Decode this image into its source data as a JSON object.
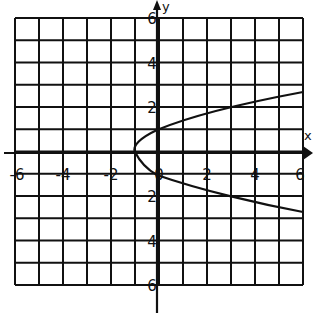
{
  "chart_data": {
    "type": "line",
    "title": "",
    "xlabel": "x",
    "ylabel": "y",
    "xlim": [
      -6,
      6
    ],
    "ylim": [
      -6,
      6
    ],
    "grid": true,
    "x_tick_labels": [
      "-6",
      "-4",
      "-2",
      "0",
      "2",
      "4",
      "6"
    ],
    "y_tick_labels_upper": [
      "6",
      "4",
      "2"
    ],
    "y_tick_labels_lower": [
      "2",
      "4",
      "6"
    ],
    "origin_label": "0",
    "series": [
      {
        "name": "sideways parabola opening right",
        "points": [
          {
            "x": 6,
            "y": 2.6
          },
          {
            "x": 4,
            "y": 2.2
          },
          {
            "x": 2,
            "y": 1.5
          },
          {
            "x": 0,
            "y": 1.0
          },
          {
            "x": -0.9,
            "y": 0.1
          },
          {
            "x": 0,
            "y": -1.0
          },
          {
            "x": 2,
            "y": -1.7
          },
          {
            "x": 4,
            "y": -2.3
          },
          {
            "x": 6,
            "y": -2.6
          }
        ]
      }
    ]
  },
  "layout": {
    "grid_left": 15,
    "grid_top": 18,
    "grid_right": 303,
    "grid_bottom": 285,
    "cols": 12,
    "rows": 12,
    "xaxis_y": 153,
    "yaxis_x": 157,
    "curve_path": "M303,92 C260,100 200,112 157,130 C140,138 132,146 135,152 C140,162 148,170 157,175 C200,190 260,204 303,212"
  }
}
